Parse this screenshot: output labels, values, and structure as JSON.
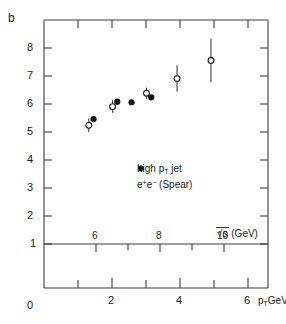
{
  "chart_data": {
    "type": "scatter",
    "title": "",
    "ylabel": "b",
    "xlabel": "p_T GeV/c",
    "secondary_xlabel": "√s (GeV)",
    "xlim": [
      0,
      6.6
    ],
    "ylim": [
      0,
      8.6
    ],
    "grid": false,
    "legend_position": "center",
    "y_ticks": [
      "8",
      "7",
      "6",
      "5",
      "4",
      "3",
      "2",
      "1",
      "0"
    ],
    "y_tick_values": [
      8,
      7,
      6,
      5,
      4,
      3,
      2,
      1,
      0
    ],
    "x_ticks": [
      "2",
      "4",
      "6"
    ],
    "x_tick_values": [
      2,
      4,
      6
    ],
    "x_minor_values": [
      1,
      3,
      5
    ],
    "secondary_x_ticks": [
      "6",
      "8",
      "10"
    ],
    "secondary_x_tick_values": [
      6,
      8,
      10
    ],
    "secondary_x_minor_values": [
      7,
      9
    ],
    "secondary_axis_b_level": 1.0,
    "series": [
      {
        "name": "high p_T jet",
        "marker": "open-circle",
        "points": [
          {
            "x": 1.32,
            "y": 5.22,
            "yerr": 0.22
          },
          {
            "x": 2.02,
            "y": 5.82,
            "yerr": 0.2
          },
          {
            "x": 3.02,
            "y": 6.25,
            "yerr": 0.18
          },
          {
            "x": 3.92,
            "y": 6.72,
            "yerr": 0.42
          },
          {
            "x": 4.92,
            "y": 7.3,
            "yerr": 0.7
          }
        ]
      },
      {
        "name": "e+e- (Spear)",
        "marker": "filled-circle",
        "points": [
          {
            "x": 1.46,
            "y": 5.42,
            "yerr": 0
          },
          {
            "x": 2.16,
            "y": 5.98,
            "yerr": 0
          },
          {
            "x": 2.58,
            "y": 5.96,
            "yerr": 0
          },
          {
            "x": 3.16,
            "y": 6.12,
            "yerr": 0
          }
        ]
      }
    ],
    "legend": [
      {
        "marker": "open-circle",
        "label_html": "high p<sub>T</sub> jet"
      },
      {
        "marker": "filled-circle",
        "label_html": "e<sup>+</sup>e<sup>−</sup> (Spear)"
      }
    ]
  },
  "labels": {
    "y_axis_title": "b",
    "y_8": "8",
    "y_7": "7",
    "y_6": "6",
    "y_5": "5",
    "y_4": "4",
    "y_3": "3",
    "y_2": "2",
    "y_1": "1",
    "y_0": "0",
    "x_2": "2",
    "x_4": "4",
    "x_6": "6",
    "s_6": "6",
    "s_8": "8",
    "s_10": "10"
  },
  "colors": {
    "axis": "#3c3c3c",
    "marker": "#121212",
    "background": "#ffffff"
  }
}
